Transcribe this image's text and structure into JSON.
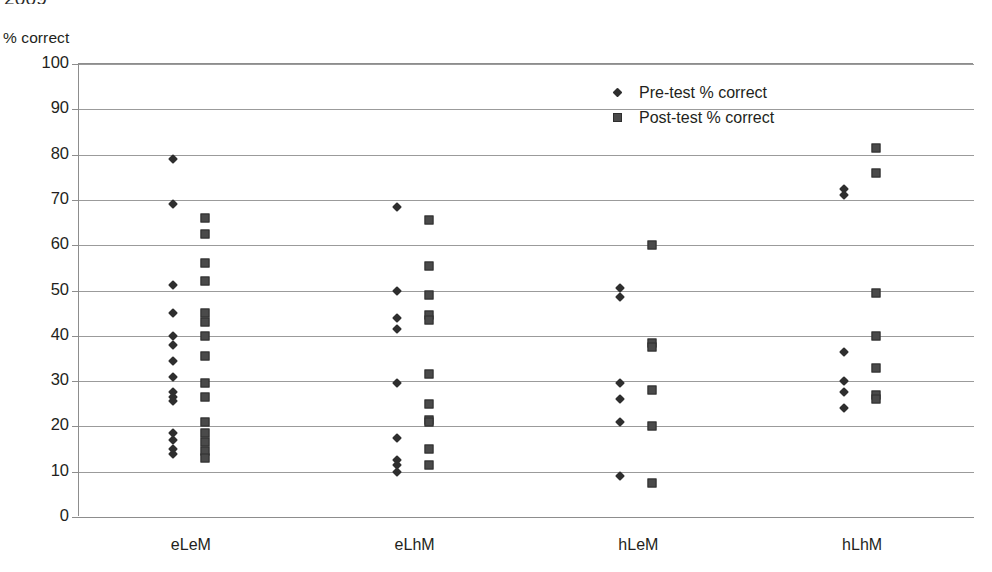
{
  "page": {
    "clipped_header_text": "2009"
  },
  "chart_data": {
    "type": "scatter",
    "title": "",
    "xlabel": "",
    "ylabel": "% correct",
    "ylim": [
      0,
      100
    ],
    "ytick_step": 10,
    "yticks": [
      100,
      90,
      80,
      70,
      60,
      50,
      40,
      30,
      20,
      10,
      0
    ],
    "ytick_labels": [
      "100",
      "90",
      "80",
      "70",
      "60",
      "50",
      "40",
      "30",
      "20",
      "10",
      "0"
    ],
    "grid": true,
    "grid_axis": "y",
    "categories": [
      "eLeM",
      "eLhM",
      "hLeM",
      "hLhM"
    ],
    "legend_position": "upper-center",
    "legend": [
      "Pre-test % correct",
      "Post-test % correct"
    ],
    "series": [
      {
        "name": "Pre-test % correct",
        "marker": "diamond",
        "color": "#2e2e2e",
        "points": [
          {
            "category": "eLeM",
            "values": [
              79.0,
              69.2,
              51.3,
              45.0,
              40.0,
              38.0,
              34.5,
              31.0,
              27.5,
              26.5,
              25.5,
              18.5,
              17.0,
              15.0,
              14.0
            ]
          },
          {
            "category": "eLhM",
            "values": [
              68.5,
              50.0,
              44.0,
              41.5,
              29.5,
              17.5,
              12.5,
              11.5,
              10.0
            ]
          },
          {
            "category": "hLeM",
            "values": [
              50.5,
              48.5,
              29.5,
              26.0,
              21.0,
              9.0
            ]
          },
          {
            "category": "hLhM",
            "values": [
              72.5,
              71.0,
              36.5,
              30.0,
              27.5,
              24.0
            ]
          }
        ]
      },
      {
        "name": "Post-test % correct",
        "marker": "square",
        "color": "#4a4a4a",
        "points": [
          {
            "category": "eLeM",
            "values": [
              66.0,
              62.5,
              56.0,
              52.0,
              45.0,
              43.0,
              40.0,
              35.5,
              29.5,
              26.5,
              21.0,
              18.5,
              16.5,
              14.5,
              13.0
            ]
          },
          {
            "category": "eLhM",
            "values": [
              65.5,
              55.5,
              49.0,
              44.5,
              43.5,
              31.5,
              25.0,
              21.5,
              21.0,
              15.0,
              11.5
            ]
          },
          {
            "category": "hLeM",
            "values": [
              60.0,
              38.5,
              37.5,
              28.0,
              20.0,
              7.5
            ]
          },
          {
            "category": "hLhM",
            "values": [
              81.5,
              76.0,
              49.5,
              40.0,
              33.0,
              27.0,
              26.0
            ]
          }
        ]
      }
    ]
  }
}
